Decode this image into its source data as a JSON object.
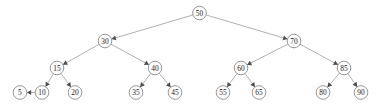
{
  "figure": {
    "name": "binary-search-tree-diagram",
    "background_color": "#ffffff",
    "edge_color": "#a8a8a8",
    "arrow_color": "#4d4d4d",
    "node_fill": "#fdfdfd",
    "node_stroke": "#8c8c8c",
    "label_color": "#1f1f1f",
    "node_radius": 6.8,
    "width": 380,
    "height": 111
  },
  "chart_data": {
    "type": "diagram",
    "subtype": "binary-search-tree",
    "title": "",
    "nodes": [
      {
        "id": "n50",
        "label": "50",
        "x": 199.5,
        "y": 13,
        "level": 0
      },
      {
        "id": "n30",
        "label": "30",
        "x": 105.0,
        "y": 41,
        "level": 1
      },
      {
        "id": "n70",
        "label": "70",
        "x": 294.0,
        "y": 41,
        "level": 1
      },
      {
        "id": "n15",
        "label": "15",
        "x": 57.0,
        "y": 68,
        "level": 2
      },
      {
        "id": "n40",
        "label": "40",
        "x": 155.0,
        "y": 68,
        "level": 2
      },
      {
        "id": "n60",
        "label": "60",
        "x": 241.0,
        "y": 68,
        "level": 2
      },
      {
        "id": "n85",
        "label": "85",
        "x": 344.0,
        "y": 68,
        "level": 2
      },
      {
        "id": "n5",
        "label": "5",
        "x": 20.0,
        "y": 92.5,
        "level": 3
      },
      {
        "id": "n10",
        "label": "10",
        "x": 42.0,
        "y": 92.5,
        "level": 3
      },
      {
        "id": "n20",
        "label": "20",
        "x": 75.0,
        "y": 92.5,
        "level": 3
      },
      {
        "id": "n35",
        "label": "35",
        "x": 136.0,
        "y": 92.5,
        "level": 3
      },
      {
        "id": "n45",
        "label": "45",
        "x": 175.0,
        "y": 92.5,
        "level": 3
      },
      {
        "id": "n55",
        "label": "55",
        "x": 223.0,
        "y": 92.5,
        "level": 3
      },
      {
        "id": "n65",
        "label": "65",
        "x": 259.0,
        "y": 92.5,
        "level": 3
      },
      {
        "id": "n80",
        "label": "80",
        "x": 323.0,
        "y": 92.5,
        "level": 3
      },
      {
        "id": "n90",
        "label": "90",
        "x": 361.0,
        "y": 92.5,
        "level": 3
      }
    ],
    "edges": [
      {
        "from": "n50",
        "to": "n30",
        "directed": true
      },
      {
        "from": "n50",
        "to": "n70",
        "directed": true
      },
      {
        "from": "n30",
        "to": "n15",
        "directed": true
      },
      {
        "from": "n30",
        "to": "n40",
        "directed": true
      },
      {
        "from": "n70",
        "to": "n60",
        "directed": true
      },
      {
        "from": "n70",
        "to": "n85",
        "directed": true
      },
      {
        "from": "n15",
        "to": "n10",
        "directed": true
      },
      {
        "from": "n15",
        "to": "n20",
        "directed": true
      },
      {
        "from": "n40",
        "to": "n35",
        "directed": true
      },
      {
        "from": "n40",
        "to": "n45",
        "directed": true
      },
      {
        "from": "n60",
        "to": "n55",
        "directed": true
      },
      {
        "from": "n60",
        "to": "n65",
        "directed": true
      },
      {
        "from": "n85",
        "to": "n80",
        "directed": true
      },
      {
        "from": "n85",
        "to": "n90",
        "directed": true
      },
      {
        "from": "n10",
        "to": "n5",
        "directed": true
      }
    ],
    "root": "n50",
    "values": [
      50,
      30,
      70,
      15,
      40,
      60,
      85,
      5,
      10,
      20,
      35,
      45,
      55,
      65,
      80,
      90
    ]
  }
}
